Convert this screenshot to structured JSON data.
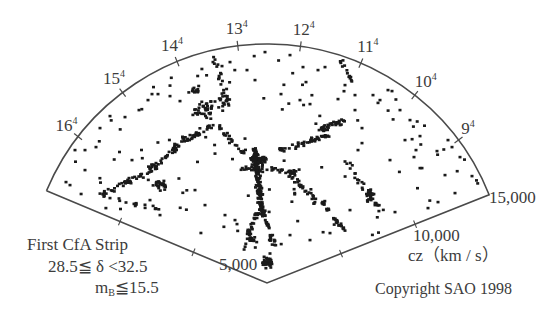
{
  "chart_data": {
    "type": "scatter",
    "subtype": "polar-wedge (redshift cone diagram)",
    "title": "First CfA Strip",
    "constraints": [
      "28.5≦ δ <32.5",
      "m_B≦15.5"
    ],
    "radial_axis": {
      "label": "cz (km / s)",
      "ticks": [
        5000,
        10000,
        15000
      ],
      "tick_labels": [
        "5,000",
        "10,000",
        "15,000"
      ],
      "range": [
        0,
        15000
      ]
    },
    "angular_axis": {
      "label": "Right Ascension (hours)",
      "ticks": [
        {
          "hour": 16,
          "label": "16",
          "sup": "h"
        },
        {
          "hour": 15,
          "label": "15",
          "sup": "h"
        },
        {
          "hour": 14,
          "label": "14",
          "sup": "h"
        },
        {
          "hour": 13,
          "label": "13",
          "sup": "h"
        },
        {
          "hour": 12,
          "label": "12",
          "sup": "h"
        },
        {
          "hour": 11,
          "label": "11",
          "sup": "h"
        },
        {
          "hour": 10,
          "label": "10",
          "sup": "h"
        },
        {
          "hour": 9,
          "label": "9",
          "sup": "h"
        }
      ],
      "range_hours": [
        8,
        17
      ]
    },
    "grid": false,
    "legend": null,
    "point_count_approx": 1100,
    "notable_structures": [
      "Coma cluster 'stick man' finger of God near 13h at ~7,000 km/s",
      "Great Wall filament spanning 9h-16h at ~7,000-10,000 km/s",
      "large voids"
    ]
  },
  "labels": {
    "ra": [
      {
        "text": "16",
        "sup": "4"
      },
      {
        "text": "15",
        "sup": "4"
      },
      {
        "text": "14",
        "sup": "4"
      },
      {
        "text": "13",
        "sup": "4"
      },
      {
        "text": "12",
        "sup": "4"
      },
      {
        "text": "11",
        "sup": "4"
      },
      {
        "text": "10",
        "sup": "4"
      },
      {
        "text": "9",
        "sup": "4"
      }
    ],
    "cz_ticks": [
      "5,000",
      "10,000",
      "15,000"
    ],
    "cz_axis": "cz（km / s）",
    "caption_line1": "First CfA Strip",
    "caption_line2": "28.5≦ δ <32.5",
    "caption_line3_m": "m",
    "caption_line3_sub": "B",
    "caption_line3_rest": "≦15.5",
    "copyright": "Copyright SAO 1998"
  },
  "colors": {
    "frame": "#4a4a4a",
    "dots": "#1a1a1a",
    "text": "#3c3c3c",
    "background": "#ffffff"
  }
}
